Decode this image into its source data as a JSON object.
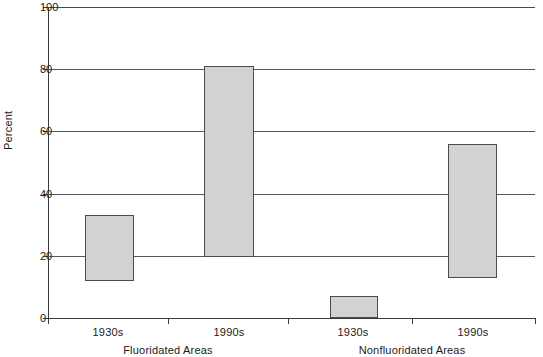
{
  "chart_data": {
    "type": "bar",
    "title": "",
    "subtitle": "",
    "xlabel": "",
    "ylabel": "Percent",
    "ylim": [
      0,
      100
    ],
    "yticks": [
      0,
      20,
      40,
      60,
      80,
      100
    ],
    "ytick_labels": [
      "0",
      "20",
      "40",
      "60",
      "80",
      "100"
    ],
    "grid": true,
    "legend": "none",
    "note": "Floating (range) bars: each bar spans from a low value to a high value.",
    "categories": [
      "1930s",
      "1990s",
      "1930s",
      "1990s"
    ],
    "groups": [
      {
        "label": "Fluoridated Areas",
        "categories": [
          "1930s",
          "1990s"
        ]
      },
      {
        "label": "Nonfluoridated Areas",
        "categories": [
          "1930s",
          "1990s"
        ]
      }
    ],
    "bars": [
      {
        "group": "Fluoridated Areas",
        "category": "1930s",
        "low": 12,
        "high": 33
      },
      {
        "group": "Fluoridated Areas",
        "category": "1990s",
        "low": 19.5,
        "high": 81
      },
      {
        "group": "Nonfluoridated Areas",
        "category": "1930s",
        "low": 0,
        "high": 7
      },
      {
        "group": "Nonfluoridated Areas",
        "category": "1990s",
        "low": 13,
        "high": 56
      }
    ],
    "bar_fill_color": "#d2d2d2",
    "bar_edge_color": "#4b4b4d",
    "gridline_color": "#58585a",
    "axis_color": "#3b3b3d",
    "background_color": "#ffffff"
  },
  "axis": {
    "y_title": "Percent",
    "ticks": [
      {
        "value": 100,
        "label": "100"
      },
      {
        "value": 80,
        "label": "80"
      },
      {
        "value": 60,
        "label": "60"
      },
      {
        "value": 40,
        "label": "40"
      },
      {
        "value": 20,
        "label": "20"
      },
      {
        "value": 0,
        "label": "0"
      }
    ]
  },
  "xaxis": {
    "tick_labels": [
      {
        "label": "1930s",
        "center_px": 108
      },
      {
        "label": "1990s",
        "center_px": 229
      },
      {
        "label": "1930s",
        "center_px": 353
      },
      {
        "label": "1990s",
        "center_px": 473
      }
    ],
    "group_labels": [
      {
        "label": "Fluoridated Areas",
        "center_px": 168
      },
      {
        "label": "Nonfluoridated Areas",
        "center_px": 412
      }
    ],
    "tick_positions_px": [
      48,
      168,
      288,
      412,
      535
    ]
  }
}
